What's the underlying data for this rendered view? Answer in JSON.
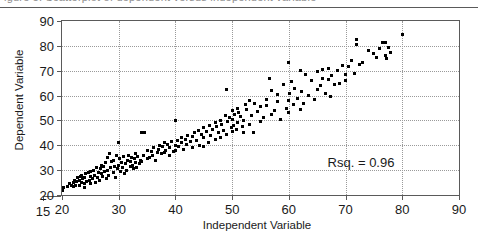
{
  "figure": {
    "clipped_caption": "igure 5. Scatterplot of dependent versus independent variable",
    "annotation": "Rsq. = 0.96"
  },
  "chart_data": {
    "type": "scatter",
    "title": "",
    "xlabel": "Independent Variable",
    "ylabel": "Dependent Variable",
    "xlim": [
      15,
      90
    ],
    "ylim": [
      20,
      90
    ],
    "xticks": [
      15,
      20,
      30,
      40,
      50,
      60,
      70,
      80,
      90
    ],
    "yticks": [
      20,
      30,
      40,
      50,
      60,
      70,
      80,
      90
    ],
    "xtick_labels": [
      "15",
      "20",
      "30",
      "40",
      "50",
      "60",
      "70",
      "80",
      "90"
    ],
    "ytick_labels": [
      "20",
      "30",
      "40",
      "50",
      "60",
      "70",
      "80",
      "90"
    ],
    "grid": true,
    "grid_style": "dotted",
    "legend": false,
    "marker": "square",
    "marker_color": "#000000",
    "annotations": [
      {
        "text": "Rsq. = 0.96",
        "x": 76,
        "y": 33
      }
    ],
    "rsq": 0.96,
    "series": [
      {
        "name": "observations",
        "x": [
          20.0,
          20.2,
          21.0,
          21.3,
          21.6,
          22.0,
          22.0,
          22.2,
          22.4,
          22.6,
          22.8,
          23.0,
          23.0,
          23.2,
          23.4,
          23.5,
          23.7,
          23.9,
          24.0,
          24.0,
          24.2,
          24.4,
          24.6,
          24.8,
          25.0,
          25.0,
          25.1,
          25.3,
          25.5,
          25.7,
          25.9,
          26.0,
          26.2,
          26.4,
          26.6,
          26.8,
          27.0,
          27.0,
          27.2,
          27.4,
          27.5,
          27.7,
          27.9,
          28.0,
          28.0,
          28.2,
          28.4,
          28.6,
          28.8,
          29.0,
          29.0,
          29.2,
          29.4,
          29.6,
          29.8,
          30.0,
          30.0,
          30.1,
          30.3,
          30.5,
          30.7,
          30.9,
          31.0,
          31.2,
          31.4,
          31.6,
          31.8,
          32.0,
          32.0,
          32.2,
          32.4,
          32.6,
          32.8,
          33.0,
          33.0,
          33.2,
          33.4,
          33.6,
          33.8,
          34.0,
          34.0,
          34.3,
          34.6,
          35.0,
          35.0,
          35.4,
          35.8,
          36.0,
          36.2,
          36.5,
          36.8,
          37.0,
          37.2,
          37.5,
          37.8,
          38.0,
          38.0,
          38.3,
          38.6,
          39.0,
          39.0,
          39.3,
          39.6,
          40.0,
          40.0,
          40.0,
          40.3,
          40.6,
          41.0,
          41.0,
          41.4,
          41.8,
          42.0,
          42.2,
          42.6,
          43.0,
          43.0,
          43.4,
          43.8,
          44.0,
          44.2,
          44.6,
          45.0,
          45.0,
          45.0,
          45.4,
          45.8,
          46.0,
          46.2,
          46.6,
          47.0,
          47.0,
          47.3,
          47.6,
          48.0,
          48.0,
          48.2,
          48.5,
          48.8,
          49.0,
          49.0,
          49.2,
          49.5,
          49.8,
          50.0,
          50.0,
          50.0,
          50.2,
          50.5,
          50.8,
          51.0,
          51.0,
          51.2,
          51.5,
          51.8,
          52.0,
          52.0,
          52.3,
          52.6,
          53.0,
          53.0,
          53.4,
          53.8,
          54.0,
          54.5,
          55.0,
          55.0,
          55.5,
          56.0,
          56.0,
          56.5,
          57.0,
          57.0,
          57.5,
          58.0,
          58.0,
          58.5,
          59.0,
          59.5,
          60.0,
          60.0,
          60.0,
          60.2,
          60.5,
          60.8,
          61.0,
          61.5,
          62.0,
          62.0,
          62.3,
          62.6,
          63.0,
          63.5,
          64.0,
          64.5,
          65.0,
          65.0,
          65.5,
          66.0,
          66.0,
          66.5,
          67.0,
          67.0,
          67.3,
          67.6,
          68.0,
          68.5,
          69.0,
          69.5,
          70.0,
          70.0,
          70.5,
          71.0,
          71.5,
          72.0,
          72.0,
          72.5,
          73.0,
          74.0,
          75.0,
          75.5,
          76.0,
          76.5,
          77.0,
          77.0,
          77.3,
          77.6,
          78.0,
          80.0
        ],
        "y": [
          22.0,
          23.0,
          23.5,
          24.5,
          24.0,
          23.5,
          25.0,
          26.0,
          24.0,
          25.5,
          27.0,
          24.0,
          26.0,
          27.5,
          25.0,
          28.0,
          26.5,
          24.5,
          23.0,
          27.0,
          28.5,
          25.5,
          29.0,
          26.0,
          24.5,
          27.5,
          29.5,
          26.5,
          30.0,
          28.0,
          25.0,
          31.0,
          27.0,
          29.0,
          26.0,
          30.5,
          28.5,
          32.0,
          27.5,
          31.5,
          29.5,
          33.0,
          26.5,
          30.0,
          35.0,
          28.0,
          36.5,
          31.0,
          33.5,
          29.0,
          34.0,
          31.5,
          27.0,
          36.0,
          30.5,
          41.0,
          32.0,
          34.5,
          29.5,
          33.0,
          31.0,
          35.5,
          28.5,
          32.5,
          30.0,
          34.0,
          36.0,
          31.5,
          33.5,
          35.0,
          32.0,
          30.5,
          34.5,
          33.0,
          36.5,
          31.0,
          35.5,
          32.5,
          34.0,
          33.5,
          45.0,
          36.0,
          45.0,
          34.5,
          38.0,
          35.0,
          37.5,
          36.0,
          39.0,
          34.0,
          37.0,
          38.5,
          40.0,
          36.5,
          39.5,
          37.0,
          41.0,
          38.0,
          40.5,
          36.0,
          39.0,
          41.5,
          37.5,
          38.0,
          40.0,
          50.0,
          42.0,
          39.5,
          41.0,
          43.0,
          38.5,
          42.5,
          40.5,
          44.0,
          41.5,
          39.0,
          43.5,
          45.0,
          42.0,
          46.0,
          40.0,
          44.5,
          39.5,
          43.0,
          47.0,
          45.5,
          41.0,
          48.0,
          44.0,
          46.5,
          42.5,
          49.0,
          47.5,
          45.0,
          43.0,
          50.0,
          48.5,
          46.0,
          52.0,
          44.5,
          62.5,
          49.5,
          51.0,
          47.0,
          45.5,
          50.5,
          54.0,
          48.0,
          52.5,
          46.5,
          49.0,
          55.0,
          53.0,
          51.5,
          47.5,
          45.0,
          50.0,
          56.5,
          54.5,
          48.5,
          58.0,
          52.0,
          45.0,
          57.0,
          53.5,
          49.5,
          55.5,
          51.0,
          58.5,
          56.0,
          67.0,
          52.5,
          62.0,
          54.0,
          57.5,
          60.5,
          50.5,
          64.5,
          55.0,
          73.5,
          53.0,
          58.0,
          61.0,
          65.5,
          56.5,
          63.0,
          59.0,
          54.5,
          70.0,
          61.5,
          57.0,
          68.5,
          60.0,
          66.0,
          58.5,
          62.5,
          69.5,
          64.0,
          70.5,
          67.0,
          61.0,
          71.0,
          66.5,
          59.5,
          68.0,
          64.5,
          70.0,
          65.0,
          72.0,
          68.5,
          66.0,
          71.5,
          74.0,
          69.0,
          82.5,
          80.5,
          72.5,
          73.5,
          78.0,
          77.0,
          75.5,
          79.0,
          81.5,
          76.0,
          81.5,
          75.0,
          79.5,
          77.5,
          84.5
        ]
      }
    ]
  }
}
